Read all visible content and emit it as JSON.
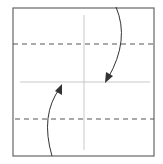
{
  "diagram": {
    "type": "origami-fold-diagram",
    "paper": {
      "x": 13,
      "y": 8,
      "width": 141,
      "height": 148,
      "stroke": "#666666"
    },
    "crease_lines": [
      {
        "kind": "valley-crease-center-vertical",
        "x1": 84,
        "y1": 15,
        "x2": 84,
        "y2": 150
      },
      {
        "kind": "valley-crease-center-horizontal",
        "x1": 20,
        "y1": 82,
        "x2": 150,
        "y2": 82
      }
    ],
    "fold_lines_dashed": [
      {
        "kind": "fold-line-upper",
        "y": 44
      },
      {
        "kind": "fold-line-lower",
        "y": 119
      }
    ],
    "arrows": [
      {
        "kind": "fold-down-arrow",
        "direction": "top edge folds down to center"
      },
      {
        "kind": "fold-up-arrow",
        "direction": "bottom edge folds up to center"
      }
    ],
    "colors": {
      "outline": "#666666",
      "crease": "#bbbbbb",
      "dash": "#555555",
      "arrow": "#333333"
    }
  }
}
